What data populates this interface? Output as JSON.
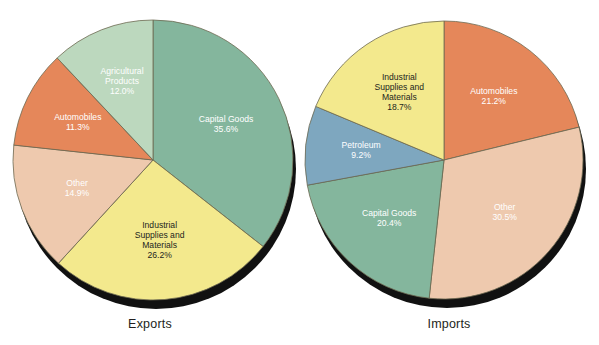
{
  "figure": {
    "background_color": "#ffffff",
    "width": 599,
    "height": 345
  },
  "chart_data": [
    {
      "type": "pie",
      "title": "Exports",
      "id": "exports",
      "xlabel": "",
      "ylabel": "",
      "legend": "none",
      "grid": false,
      "units": "percent",
      "start_angle_deg": 0,
      "direction": "clockwise",
      "center": {
        "cx": 153,
        "cy": 160,
        "r": 140
      },
      "shadow_color": "#111111",
      "categories": [
        "Capital Goods",
        "Industrial Supplies and Materials",
        "Other",
        "Automobiles",
        "Agricultural Products"
      ],
      "values": [
        35.6,
        26.2,
        14.9,
        11.3,
        12.0
      ],
      "slices": [
        {
          "label": "Capital Goods",
          "value": 35.6,
          "value_text": "35.6%",
          "color": "#84b69d",
          "text_color": "#ffffff",
          "label_lines": [
            "Capital Goods",
            "35.6%"
          ]
        },
        {
          "label": "Industrial Supplies and Materials",
          "value": 26.2,
          "value_text": "26.2%",
          "color": "#f3e98d",
          "text_color": "#231f20",
          "label_lines": [
            "Industrial",
            "Supplies and",
            "Materials",
            "26.2%"
          ]
        },
        {
          "label": "Other",
          "value": 14.9,
          "value_text": "14.9%",
          "color": "#eec9ae",
          "text_color": "#ffffff",
          "label_lines": [
            "Other",
            "14.9%"
          ]
        },
        {
          "label": "Automobiles",
          "value": 11.3,
          "value_text": "11.3%",
          "color": "#e5875a",
          "text_color": "#ffffff",
          "label_lines": [
            "Automobiles",
            "11.3%"
          ]
        },
        {
          "label": "Agricultural Products",
          "value": 12.0,
          "value_text": "12.0%",
          "color": "#bcd8be",
          "text_color": "#ffffff",
          "label_lines": [
            "Agricultural",
            "Products",
            "12.0%"
          ]
        }
      ]
    },
    {
      "type": "pie",
      "title": "Imports",
      "id": "imports",
      "xlabel": "",
      "ylabel": "",
      "legend": "none",
      "grid": false,
      "units": "percent",
      "start_angle_deg": 0,
      "direction": "clockwise",
      "center": {
        "cx": 145,
        "cy": 160,
        "r": 139
      },
      "shadow_color": "#111111",
      "categories": [
        "Automobiles",
        "Other",
        "Capital Goods",
        "Petroleum",
        "Industrial Supplies and Materials"
      ],
      "values": [
        21.2,
        30.5,
        20.4,
        9.2,
        18.7
      ],
      "slices": [
        {
          "label": "Automobiles",
          "value": 21.2,
          "value_text": "21.2%",
          "color": "#e5875a",
          "text_color": "#ffffff",
          "label_lines": [
            "Automobiles",
            "21.2%"
          ]
        },
        {
          "label": "Other",
          "value": 30.5,
          "value_text": "30.5%",
          "color": "#eec9ae",
          "text_color": "#ffffff",
          "label_lines": [
            "Other",
            "30.5%"
          ]
        },
        {
          "label": "Capital Goods",
          "value": 20.4,
          "value_text": "20.4%",
          "color": "#84b69d",
          "text_color": "#ffffff",
          "label_lines": [
            "Capital Goods",
            "20.4%"
          ]
        },
        {
          "label": "Petroleum",
          "value": 9.2,
          "value_text": "9.2%",
          "color": "#7ea7bf",
          "text_color": "#ffffff",
          "label_lines": [
            "Petroleum",
            "9.2%"
          ]
        },
        {
          "label": "Industrial Supplies and Materials",
          "value": 18.7,
          "value_text": "18.7%",
          "color": "#f3e98d",
          "text_color": "#231f20",
          "label_lines": [
            "Industrial",
            "Supplies and",
            "Materials",
            "18.7%"
          ]
        }
      ]
    }
  ],
  "captions": {
    "exports": "Exports",
    "imports": "Imports"
  }
}
